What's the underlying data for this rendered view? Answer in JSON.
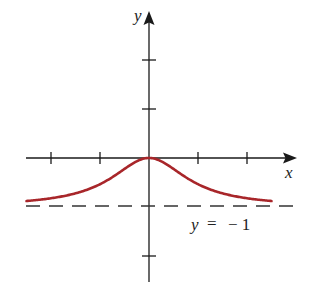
{
  "chart_data": {
    "type": "line",
    "title": "",
    "xlabel": "x",
    "ylabel": "y",
    "function_hint": "y = 2/(1+x^2) - 1",
    "xlim": [
      -2.5,
      2.5
    ],
    "ylim": [
      -2.5,
      2.9
    ],
    "x_ticks": [
      -2,
      -1,
      1,
      2
    ],
    "y_ticks": [
      2,
      1,
      -2
    ],
    "grid": false,
    "series": [
      {
        "name": "curve",
        "color": "#a8262a",
        "x": [
          -2.5,
          -2,
          -1.5,
          -1,
          -0.5,
          0,
          0.5,
          1,
          1.5,
          2,
          2.5
        ],
        "values": [
          -0.72,
          -0.6,
          -0.38,
          0,
          0.6,
          1,
          0.6,
          0,
          -0.38,
          -0.6,
          -0.72
        ]
      }
    ],
    "asymptote": {
      "label_lhs": "y",
      "label_eq": "=",
      "label_rhs": "− 1",
      "y": -1,
      "style": "dashed"
    }
  },
  "labels": {
    "x_axis": "x",
    "y_axis": "y",
    "asymptote_y": "y",
    "asymptote_eq": "=",
    "asymptote_val": "− 1"
  },
  "colors": {
    "axis": "#1a1a1a",
    "curve": "#a8262a",
    "dash": "#333333"
  }
}
